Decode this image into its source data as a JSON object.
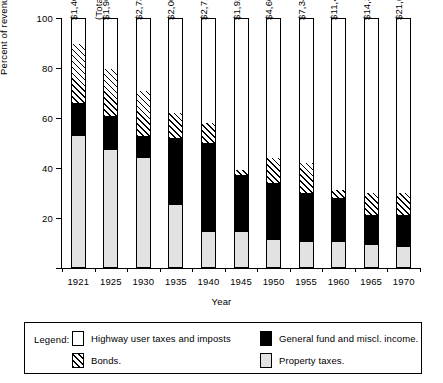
{
  "chart_data": {
    "type": "bar",
    "subtype": "stacked-bar-100-percent",
    "title": "",
    "xlabel": "Year",
    "ylabel": "Percent of revenue",
    "ylim": [
      0,
      100
    ],
    "yticks": [
      0,
      20,
      40,
      60,
      80,
      100
    ],
    "ytick_labels": [
      "",
      "20",
      "40",
      "60",
      "80",
      "100"
    ],
    "grid": false,
    "legend_position": "below-plot",
    "total_annotation": "(Total—millions)",
    "categories": [
      "1921",
      "1925",
      "1930",
      "1935",
      "1940",
      "1945",
      "1950",
      "1955",
      "1960",
      "1965",
      "1970"
    ],
    "totals": [
      "$1,409",
      "$1,964",
      "$2,735",
      "$2,063",
      "$2,719",
      "$1,929",
      "$4,606",
      "$7,345",
      "$11,485",
      "$14,371",
      "$21,652"
    ],
    "series": [
      {
        "name": "Property taxes.",
        "key": "property",
        "fill": "gray",
        "values": [
          53,
          47,
          44,
          25,
          14,
          14,
          11,
          10,
          10,
          9,
          8
        ]
      },
      {
        "name": "General fund and miscl. income.",
        "key": "general",
        "fill": "black",
        "values": [
          13,
          14,
          9,
          27,
          36,
          23,
          23,
          20,
          18,
          12,
          13
        ]
      },
      {
        "name": "Bonds.",
        "key": "bonds",
        "fill": "hatch",
        "values": [
          24,
          19,
          18,
          10,
          8,
          2,
          10,
          12,
          3,
          9,
          9
        ]
      },
      {
        "name": "Highway user taxes and imposts",
        "key": "highway",
        "fill": "white",
        "values": [
          10,
          20,
          29,
          38,
          42,
          61,
          56,
          58,
          69,
          70,
          70
        ]
      }
    ]
  },
  "legend": {
    "label": "Legend:",
    "items": [
      {
        "swatch": "white",
        "text": "Highway user taxes and imposts"
      },
      {
        "swatch": "black",
        "text": "General fund and miscl. income."
      },
      {
        "swatch": "hatch",
        "text": "Bonds."
      },
      {
        "swatch": "gray",
        "text": "Property taxes."
      }
    ]
  },
  "colors": {
    "axis": "#000000",
    "property_taxes": "#e2e2e2",
    "general_fund": "#000000",
    "bonds": "#ffffff",
    "highway_user": "#ffffff"
  }
}
